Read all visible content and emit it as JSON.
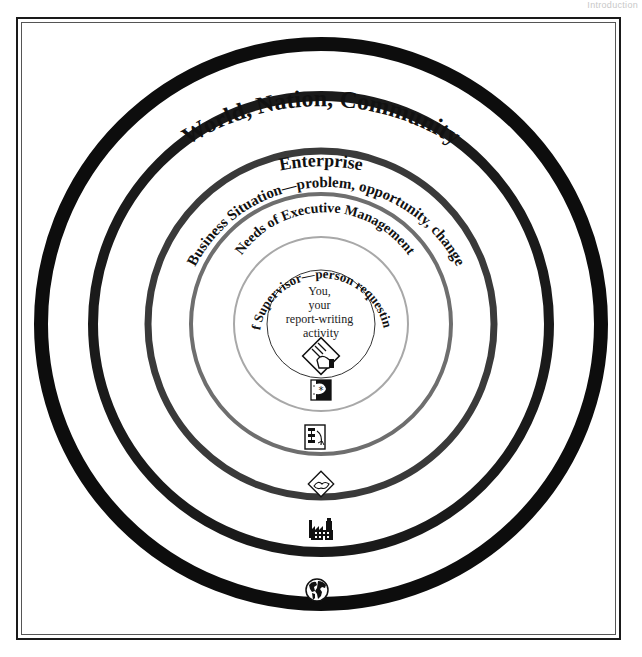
{
  "header": {
    "section": "Introduction"
  },
  "diagram": {
    "rings": [
      {
        "id": "world",
        "label": "World, Nation, Community",
        "color": "#0d0d0d",
        "icon": "globe-icon"
      },
      {
        "id": "enterprise",
        "label": "Enterprise",
        "color": "#1a1a1a",
        "icon": "factory-icon"
      },
      {
        "id": "business",
        "label": "Business Situation—problem, opportunity, change",
        "color": "#3a3a3a",
        "icon": "handshake-document-icon"
      },
      {
        "id": "executive",
        "label": "Needs of Executive Management",
        "color": "#6e6e6e",
        "icon": "organization-chart-document-icon"
      },
      {
        "id": "supervisor",
        "label": "Needs of Supervisor—person requesting report",
        "color": "#a8a8a8",
        "icon": "idea-book-icon"
      }
    ],
    "center": {
      "lines": [
        "You,",
        "your",
        "report-writing",
        "activity"
      ],
      "icon": "hand-writing-document-icon",
      "circle_color": "#333333"
    }
  }
}
